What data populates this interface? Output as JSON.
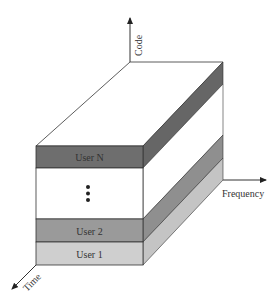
{
  "diagram": {
    "type": "3d-block",
    "axes": {
      "code": "Code",
      "frequency": "Frequency",
      "time": "Time"
    },
    "layers": [
      {
        "label": "User N",
        "color": "#6e6e6e"
      },
      {
        "label": "⋮",
        "color": "#ffffff",
        "is_ellipsis": true
      },
      {
        "label": "User 2",
        "color": "#9a9a9a"
      },
      {
        "label": "User 1",
        "color": "#cfcfcf"
      }
    ],
    "colors": {
      "userN_front": "#6e6e6e",
      "userN_side": "#666666",
      "user2_front": "#9a9a9a",
      "user2_side": "#8f8f8f",
      "user1_front": "#cfcfcf",
      "user1_side": "#c4c4c4",
      "outline": "#333333"
    }
  }
}
